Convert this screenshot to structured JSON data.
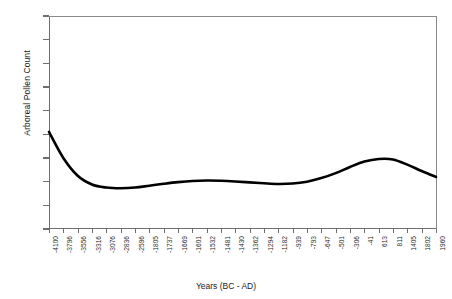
{
  "chart_data": {
    "type": "line",
    "title": "",
    "xlabel": "Years (BC - AD)",
    "ylabel": "Arboreal Pollen Count",
    "ylim": [
      0,
      900
    ],
    "ytick_step": 100,
    "yticks": [
      0,
      100,
      200,
      300,
      400,
      500,
      600,
      700,
      800,
      900
    ],
    "grid": false,
    "legend": "none",
    "line_color": "#000000",
    "axis_color": "#6e6e6e",
    "categories": [
      "-4100",
      "-3796",
      "-3556",
      "-3316",
      "-3076",
      "-2836",
      "-2596",
      "-1805",
      "-1737",
      "-1669",
      "-1601",
      "-1532",
      "-1481",
      "-1430",
      "-1362",
      "-1294",
      "-1182",
      "-939",
      "-793",
      "-647",
      "-501",
      "-306",
      "-41",
      "613",
      "811",
      "1405",
      "1802",
      "1960"
    ],
    "values": [
      410,
      300,
      225,
      188,
      175,
      172,
      175,
      183,
      191,
      198,
      203,
      205,
      204,
      201,
      197,
      193,
      190,
      192,
      200,
      215,
      236,
      262,
      285,
      296,
      294,
      272,
      245,
      220
    ],
    "series": [
      {
        "name": "Arboreal Pollen Count",
        "values": [
          410,
          300,
          225,
          188,
          175,
          172,
          175,
          183,
          191,
          198,
          203,
          205,
          204,
          201,
          197,
          193,
          190,
          192,
          200,
          215,
          236,
          262,
          285,
          296,
          294,
          272,
          245,
          220
        ]
      }
    ]
  }
}
